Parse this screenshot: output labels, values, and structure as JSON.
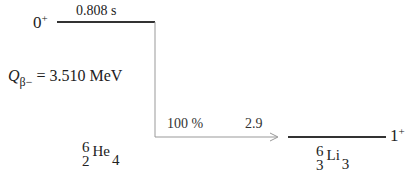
{
  "parent": {
    "spin_parity": {
      "value": "0",
      "parity": "+"
    },
    "half_life": "0.808 s",
    "q_value": {
      "symbol": "Q",
      "subscript": "β−",
      "text": "= 3.510 MeV"
    },
    "nuclide": {
      "mass_number": "6",
      "atomic_number": "2",
      "symbol": "He",
      "neutron_number": "4"
    }
  },
  "transition": {
    "branching": "100 %",
    "log_ft": "2.9"
  },
  "daughter": {
    "spin_parity": {
      "value": "1",
      "parity": "+"
    },
    "nuclide": {
      "mass_number": "6",
      "atomic_number": "3",
      "symbol": "Li",
      "neutron_number": "3"
    }
  },
  "colors": {
    "level_line": "#333333",
    "transition_line": "#999999"
  }
}
